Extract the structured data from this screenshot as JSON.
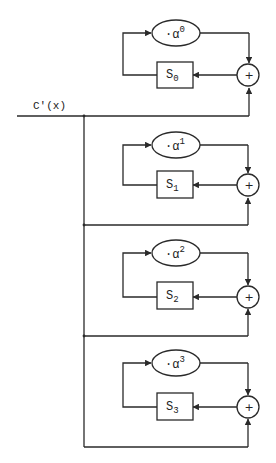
{
  "diagram": {
    "input_label": "C'(x)",
    "colors": {
      "line": "#2a2a2a",
      "background": "#ffffff"
    },
    "adder_symbol": "+",
    "blocks": [
      {
        "index": 0,
        "multiplier_prefix": "·α",
        "multiplier_exponent": "0",
        "register_base": "S",
        "register_sub": "0"
      },
      {
        "index": 1,
        "multiplier_prefix": "·α",
        "multiplier_exponent": "1",
        "register_base": "S",
        "register_sub": "1"
      },
      {
        "index": 2,
        "multiplier_prefix": "·α",
        "multiplier_exponent": "2",
        "register_base": "S",
        "register_sub": "2"
      },
      {
        "index": 3,
        "multiplier_prefix": "·α",
        "multiplier_exponent": "3",
        "register_base": "S",
        "register_sub": "3"
      }
    ]
  }
}
